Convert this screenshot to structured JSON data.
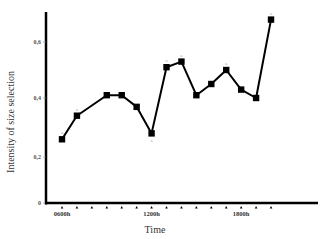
{
  "chart_data": {
    "type": "line",
    "title": "",
    "xlabel": "Time",
    "ylabel": "Intensity of size selection",
    "ylim": [
      0,
      0.7
    ],
    "yticks": [
      0,
      0.2,
      0.4,
      0.6
    ],
    "ytick_labels": [
      "0",
      "0,2",
      "0,4",
      "0,6"
    ],
    "x_tick_count": 15,
    "x_tick_labels": [
      {
        "index": 0,
        "label": "0600h"
      },
      {
        "index": 6,
        "label": "1200h"
      },
      {
        "index": 12,
        "label": "1800h"
      }
    ],
    "grid": false,
    "legend": null,
    "series": [
      {
        "name": "Intensity of size selection",
        "marker": "square",
        "x_index": [
          0,
          1,
          3,
          4,
          5,
          6,
          7,
          8,
          9,
          10,
          11,
          12,
          13,
          14
        ],
        "values": [
          0.26,
          0.34,
          0.41,
          0.41,
          0.37,
          0.28,
          0.51,
          0.53,
          0.41,
          0.45,
          0.5,
          0.43,
          0.4,
          0.68
        ],
        "annotations": [
          {
            "x_index": 0,
            "text": "a",
            "position": "above"
          },
          {
            "x_index": 1,
            "text": "a",
            "position": "above"
          },
          {
            "x_index": 6,
            "text": "a",
            "position": "below"
          },
          {
            "x_index": 7,
            "text": "a",
            "position": "above"
          },
          {
            "x_index": 8,
            "text": "a",
            "position": "above"
          },
          {
            "x_index": 11,
            "text": "a",
            "position": "above"
          },
          {
            "x_index": 14,
            "text": "a",
            "position": "above"
          }
        ]
      }
    ]
  }
}
